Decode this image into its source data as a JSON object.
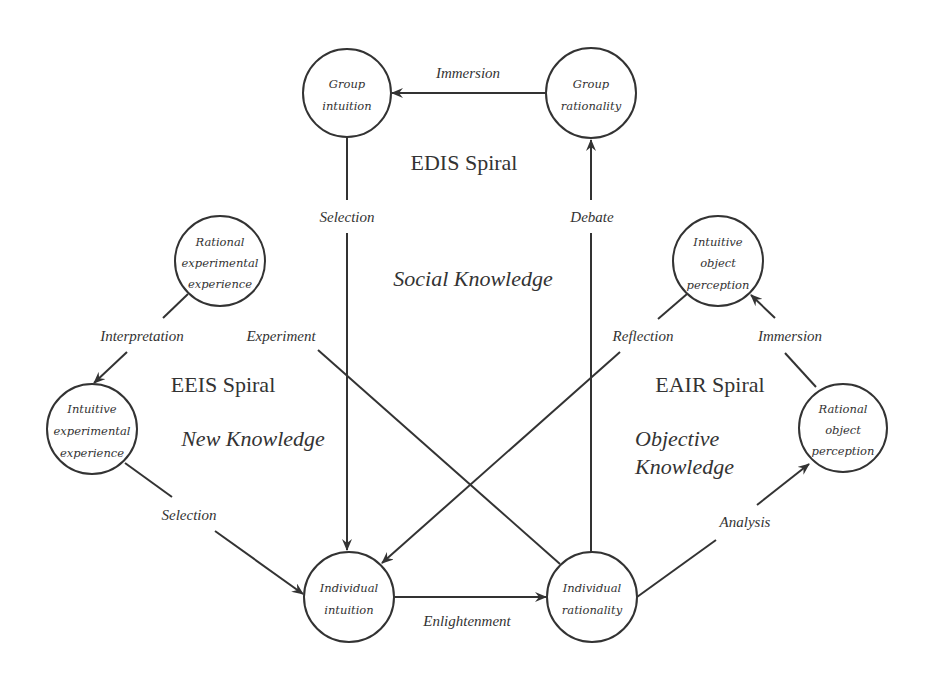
{
  "diagram": {
    "type": "knowledge-spiral-network",
    "nodes": {
      "group_intuition": {
        "lines": [
          "Group",
          "intuition"
        ]
      },
      "group_rationality": {
        "lines": [
          "Group",
          "rationality"
        ]
      },
      "rational_experimental_experience": {
        "lines": [
          "Rational",
          "experimental",
          "experience"
        ]
      },
      "intuitive_experimental_experience": {
        "lines": [
          "Intuitive",
          "experimental",
          "experience"
        ]
      },
      "intuitive_object_perception": {
        "lines": [
          "Intuitive",
          "object",
          "perception"
        ]
      },
      "rational_object_perception": {
        "lines": [
          "Rational",
          "object",
          "perception"
        ]
      },
      "individual_intuition": {
        "lines": [
          "Individual",
          "intuition"
        ]
      },
      "individual_rationality": {
        "lines": [
          "Individual",
          "rationality"
        ]
      }
    },
    "edges": {
      "immersion_top": "Immersion",
      "selection_top": "Selection",
      "debate": "Debate",
      "interpretation": "Interpretation",
      "experiment": "Experiment",
      "reflection": "Reflection",
      "immersion_right": "Immersion",
      "selection_left": "Selection",
      "enlightenment": "Enlightenment",
      "analysis": "Analysis"
    },
    "spirals": {
      "edis": "EDIS Spiral",
      "eeis": "EEIS Spiral",
      "eair": "EAIR Spiral"
    },
    "knowledge": {
      "social": "Social Knowledge",
      "new": "New Knowledge",
      "objective_line1": "Objective",
      "objective_line2": "Knowledge"
    },
    "colors": {
      "stroke": "#333333",
      "background": "#ffffff"
    }
  }
}
